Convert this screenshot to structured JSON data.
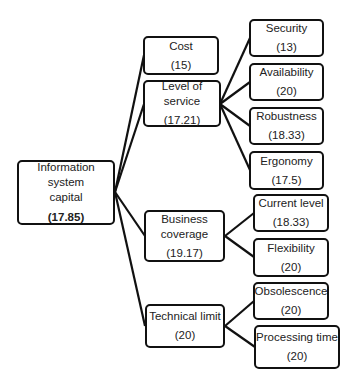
{
  "diagram": {
    "root": {
      "label_line1": "Information system",
      "label_line2": "capital",
      "value": "(17.85)"
    },
    "level1": [
      {
        "label": "Cost",
        "value": "(15)"
      },
      {
        "label": "Level of service",
        "value": "(17.21)"
      },
      {
        "label_line1": "Business",
        "label_line2": "coverage",
        "value": "(19.17)"
      },
      {
        "label": "Technical limit",
        "value": "(20)"
      }
    ],
    "level2": [
      {
        "label": "Security",
        "value": "(13)",
        "parent": "Level of service"
      },
      {
        "label": "Availability",
        "value": "(20)",
        "parent": "Level of service"
      },
      {
        "label": "Robustness",
        "value": "(18.33)",
        "parent": "Level of service"
      },
      {
        "label": "Ergonomy",
        "value": "(17.5)",
        "parent": "Level of service"
      },
      {
        "label": "Current level",
        "value": "(18.33)",
        "parent": "Business coverage"
      },
      {
        "label": "Flexibility",
        "value": "(20)",
        "parent": "Business coverage"
      },
      {
        "label": "Obsolescence",
        "value": "(20)",
        "parent": "Technical limit"
      },
      {
        "label": "Processing time",
        "value": "(20)",
        "parent": "Technical limit"
      }
    ],
    "colors": {
      "stroke": "#111111",
      "background": "#ffffff",
      "text": "#222222"
    }
  }
}
